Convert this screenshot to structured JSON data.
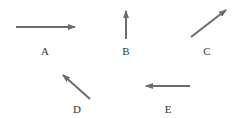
{
  "diagram": {
    "type": "vector-arrows",
    "arrow_color": "#6b6b6b",
    "label_color": "#333333",
    "arrows": [
      {
        "id": "A",
        "label": "A",
        "direction": "right",
        "x1": 16,
        "y1": 27,
        "x2": 75,
        "y2": 27,
        "lx": 45,
        "ly": 55
      },
      {
        "id": "B",
        "label": "B",
        "direction": "up",
        "x1": 126,
        "y1": 39,
        "x2": 126,
        "y2": 11,
        "lx": 126,
        "ly": 55
      },
      {
        "id": "C",
        "label": "C",
        "direction": "up-right",
        "x1": 191,
        "y1": 37,
        "x2": 226,
        "y2": 10,
        "lx": 207,
        "ly": 55
      },
      {
        "id": "D",
        "label": "D",
        "direction": "up-left",
        "x1": 90,
        "y1": 99,
        "x2": 63,
        "y2": 75,
        "lx": 77,
        "ly": 113
      },
      {
        "id": "E",
        "label": "E",
        "direction": "left",
        "x1": 190,
        "y1": 86,
        "x2": 146,
        "y2": 86,
        "lx": 168,
        "ly": 113
      }
    ]
  }
}
